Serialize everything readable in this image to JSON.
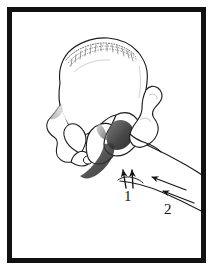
{
  "figure": {
    "domain": "anatomical-line-drawing",
    "background_color": "#ffffff",
    "ink_color": "#141414",
    "frame": {
      "name": "border-frame",
      "color": "#111111",
      "thickness_px": 5,
      "margin_px": 7,
      "style": "solid rectangle"
    },
    "labels": [
      {
        "id": "label-1",
        "text": "1",
        "x": 124,
        "y": 189,
        "refers_to": "short vertical arrows at the inferior acetabulum / ischium junction"
      },
      {
        "id": "label-2",
        "text": "2",
        "x": 164,
        "y": 202,
        "refers_to": "arrows along the femoral shaft directed proximally"
      }
    ],
    "structures": [
      {
        "name": "ilium",
        "description": "large fan-shaped upper wing of the hip bone"
      },
      {
        "name": "iliac-crest",
        "description": "stippled hatched superior border of the ilium"
      },
      {
        "name": "acetabulum",
        "description": "dark shaded cup receiving the femoral head"
      },
      {
        "name": "ischium",
        "description": "lower posterior portion with dark shading"
      },
      {
        "name": "pubis",
        "description": "anterior lower bone forming the obturator foramen"
      },
      {
        "name": "obturator-foramen",
        "description": "large oval opening between pubis and ischium"
      },
      {
        "name": "greater-trochanter",
        "description": "lateral bony prominence of the proximal femur"
      },
      {
        "name": "femoral-neck",
        "description": "narrow segment joining head to shaft"
      },
      {
        "name": "femoral-shaft",
        "description": "long bone extending to the lower right beyond the frame"
      }
    ],
    "arrows": {
      "group_1": {
        "count": 2,
        "direction": "upward (superior)",
        "style": "short straight shafts with small barbed heads"
      },
      "group_2": {
        "count": 2,
        "direction": "up and to the left (proximal along shaft)",
        "style": "long straight shafts with small barbed heads"
      }
    }
  }
}
